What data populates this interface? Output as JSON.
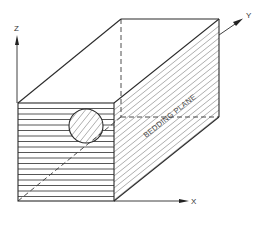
{
  "figure": {
    "axes": {
      "x_label": "X",
      "y_label": "Y",
      "z_label": "Z"
    },
    "annotations": {
      "bedding_plane": "BEDDING PLANE"
    },
    "colors": {
      "line": "#2a2a2a",
      "background": "#ffffff"
    }
  }
}
